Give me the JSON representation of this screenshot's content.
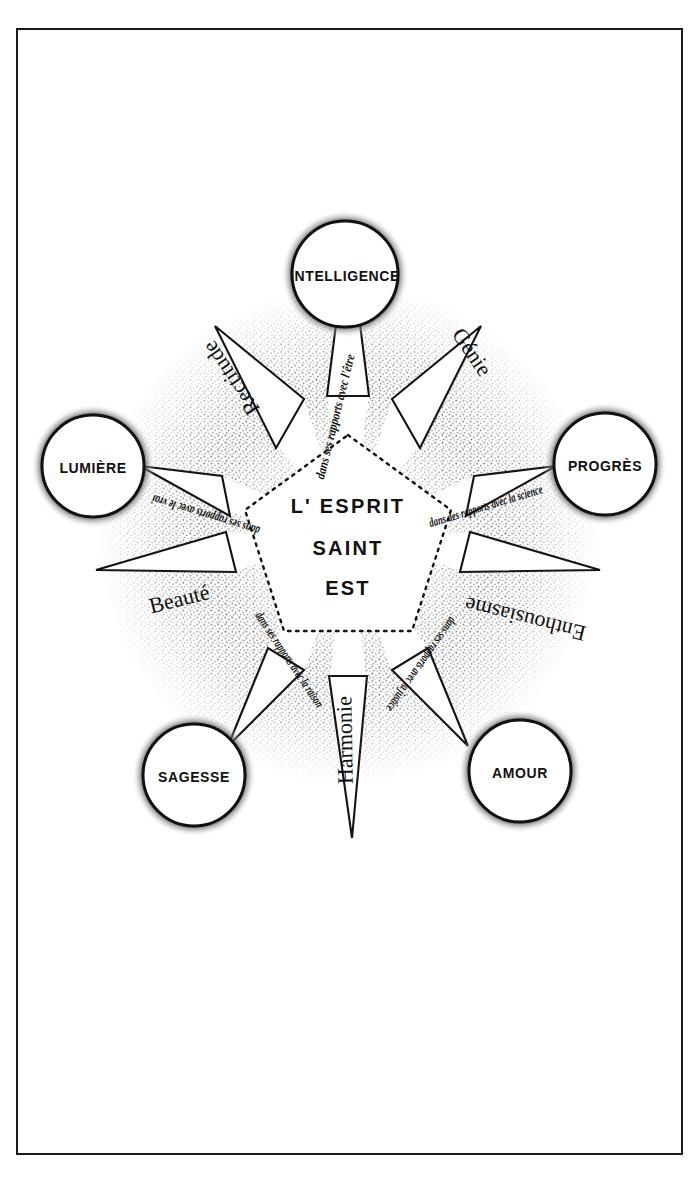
{
  "page": {
    "background_color": "#ffffff",
    "ink_color": "#111111",
    "frame_color": "#1a1a1a"
  },
  "center": {
    "line1": "L' ESPRIT",
    "line2": "SAINT",
    "line3": "EST"
  },
  "nodes": [
    {
      "label": "INTELLIGENCE",
      "position": "top"
    },
    {
      "label": "PROGRÈS",
      "position": "right"
    },
    {
      "label": "AMOUR",
      "position": "bottom-right"
    },
    {
      "label": "SAGESSE",
      "position": "bottom-left"
    },
    {
      "label": "LUMIÈRE",
      "position": "left"
    }
  ],
  "relations": [
    {
      "text": "dans ses rapports avec l'être",
      "toward": "INTELLIGENCE",
      "orientation": "upright"
    },
    {
      "text": "dans des rapports avec la science",
      "toward": "PROGRÈS",
      "orientation": "upright"
    },
    {
      "text": "dans ses rapports avec la justice",
      "toward": "AMOUR",
      "orientation": "inverted"
    },
    {
      "text": "dans ses rapports avec la raison",
      "toward": "SAGESSE",
      "orientation": "inverted"
    },
    {
      "text": "dans ses rapports avec le vrai",
      "toward": "LUMIÈRE",
      "orientation": "inverted"
    }
  ],
  "attributes": [
    {
      "label": "Génie",
      "position": "upper-right",
      "orientation": "upright"
    },
    {
      "label": "Enthousiasme",
      "position": "right",
      "orientation": "inverted"
    },
    {
      "label": "Harmonie",
      "position": "bottom",
      "orientation": "upright"
    },
    {
      "label": "Beauté",
      "position": "left",
      "orientation": "upright"
    },
    {
      "label": "Rectitude",
      "position": "upper-left",
      "orientation": "inverted"
    }
  ]
}
